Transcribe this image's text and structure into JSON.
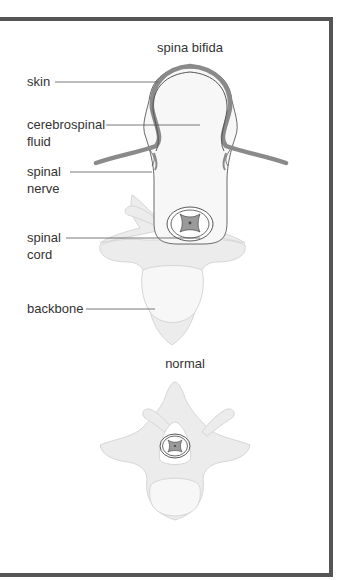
{
  "figure": {
    "top_title": "spina bifida",
    "bottom_title": "normal",
    "labels": {
      "skin": "skin",
      "csf_line1": "cerebrospinal",
      "csf_line2": "fluid",
      "nerve_line1": "spinal",
      "nerve_line2": "nerve",
      "cord_line1": "spinal",
      "cord_line2": "cord",
      "backbone": "backbone"
    }
  },
  "colors": {
    "frame": "#555555",
    "skin_band": "#8a8a8a",
    "bone_fill": "#ececec",
    "bone_stroke": "#d6d6d6",
    "outline": "#444444",
    "cord_fill": "#9a9a9a",
    "text": "#333333"
  }
}
